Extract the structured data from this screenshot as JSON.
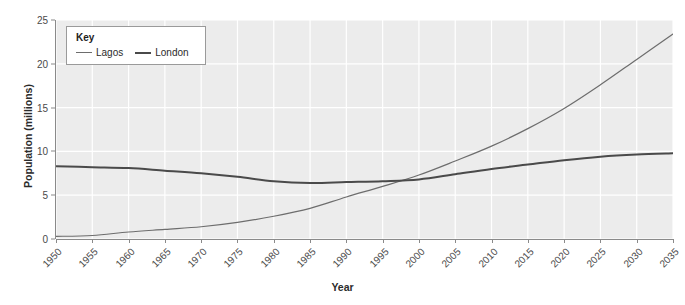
{
  "chart_data": {
    "type": "line",
    "title": "",
    "xlabel": "Year",
    "ylabel": "Population (millions)",
    "xlim": [
      1950,
      2035
    ],
    "ylim": [
      0,
      25
    ],
    "ytick_values": [
      0,
      5,
      10,
      15,
      20,
      25
    ],
    "xtick_values": [
      1950,
      1955,
      1960,
      1965,
      1970,
      1975,
      1980,
      1985,
      1990,
      1995,
      2000,
      2005,
      2010,
      2015,
      2020,
      2025,
      2030,
      2035
    ],
    "grid": true,
    "legend_position": "top-left-inside",
    "legend_title": "Key",
    "x": [
      1950,
      1955,
      1960,
      1965,
      1970,
      1975,
      1980,
      1985,
      1990,
      1995,
      2000,
      2005,
      2010,
      2015,
      2020,
      2025,
      2030,
      2035
    ],
    "series": [
      {
        "name": "Lagos",
        "color": "#6d6d6d",
        "width": 1.2,
        "values": [
          0.3,
          0.4,
          0.8,
          1.1,
          1.4,
          1.9,
          2.6,
          3.5,
          4.8,
          6.0,
          7.3,
          8.9,
          10.6,
          12.6,
          14.9,
          17.6,
          20.5,
          23.4
        ]
      },
      {
        "name": "London",
        "color": "#4a4a4a",
        "width": 2.0,
        "values": [
          8.3,
          8.2,
          8.1,
          7.8,
          7.5,
          7.1,
          6.6,
          6.4,
          6.5,
          6.6,
          6.8,
          7.4,
          8.0,
          8.5,
          9.0,
          9.4,
          9.65,
          9.8
        ]
      }
    ],
    "annotations": [
      {
        "text": "Lagos overtakes London",
        "year": 1999,
        "value": 6.7
      }
    ]
  },
  "colors": {
    "plot_background": "#ececec",
    "gridline": "#ffffff",
    "axis": "#8a8a8a",
    "text": "#2b2b2b",
    "tick_text": "#4a4a4a",
    "legend_border": "#9a9a9a",
    "legend_background": "#ffffff"
  }
}
